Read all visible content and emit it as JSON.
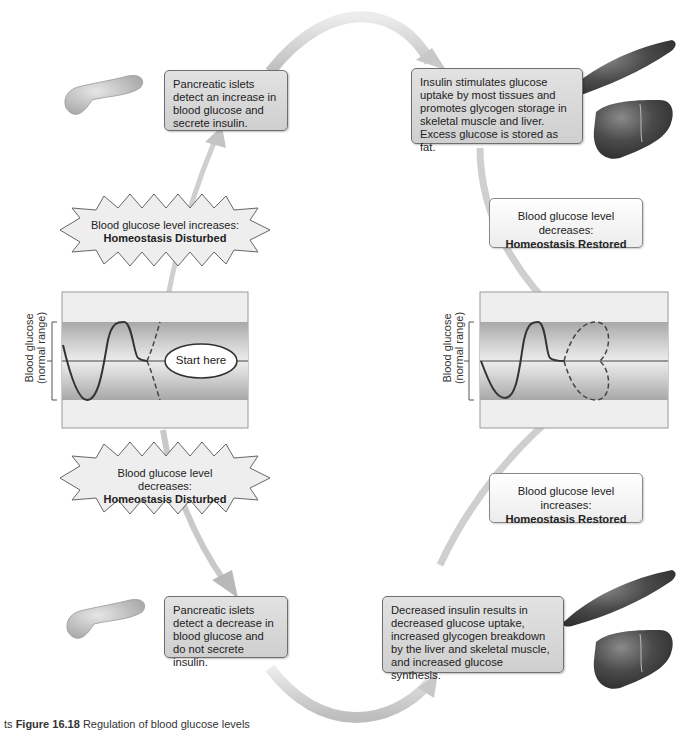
{
  "figure": {
    "caption_prefix": "ts",
    "caption_label": "Figure 16.18",
    "caption_text": "Regulation of blood glucose levels"
  },
  "boxes": {
    "top_left": "Pancreatic islets detect an increase in blood glucose and secrete insulin.",
    "top_right": "Insulin stimulates glucose uptake by most tissues and promotes glycogen storage in skeletal muscle and liver. Excess glucose is stored as fat.",
    "bottom_left": "Pancreatic islets detect a decrease in blood glucose and do not secrete insulin.",
    "bottom_right": "Decreased insulin results in decreased glucose uptake, increased glycogen breakdown by the liver and skeletal muscle, and increased glucose synthesis."
  },
  "bursts": {
    "upper": {
      "line1": "Blood glucose level increases:",
      "line2": "Homeostasis Disturbed"
    },
    "lower": {
      "line1": "Blood glucose level decreases:",
      "line2": "Homeostasis Disturbed"
    }
  },
  "status": {
    "upper": {
      "line1": "Blood glucose level decreases:",
      "line2": "Homeostasis Restored"
    },
    "lower": {
      "line1": "Blood glucose level increases:",
      "line2": "Homeostasis Restored"
    }
  },
  "graphs": {
    "left": {
      "ylabel_line1": "Blood glucose",
      "ylabel_line2": "(normal range)",
      "start_label": "Start here"
    },
    "right": {
      "ylabel_line1": "Blood glucose",
      "ylabel_line2": "(normal range)"
    }
  },
  "icons": {
    "pancreas": "pancreas-illustration",
    "muscle": "skeletal-muscle-illustration",
    "liver": "liver-illustration"
  },
  "colors": {
    "box_fill": "#d8d8d8",
    "box_border": "#6e6e6e",
    "band_dark": "#b4b4b4",
    "band_light": "#eeeeee",
    "arrow": "#d2d2d2",
    "organ": "#4a4a4a"
  }
}
